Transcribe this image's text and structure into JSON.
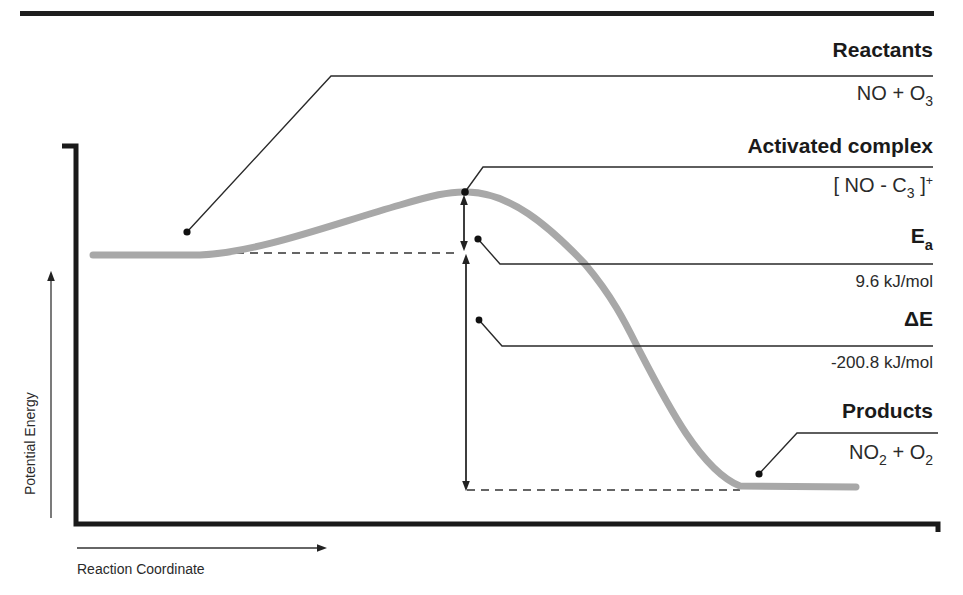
{
  "diagram": {
    "type": "reaction-energy-profile",
    "axes": {
      "x_label": "Reaction Coordinate",
      "y_label": "Potential Energy"
    },
    "labels": {
      "reactants": {
        "title": "Reactants",
        "formula_main": "NO + O",
        "formula_sub": "3"
      },
      "activated_complex": {
        "title": "Activated complex",
        "formula_pre": "[ NO - C",
        "formula_sub": "3",
        "formula_post": " ]",
        "formula_sup": "+"
      },
      "activation_energy": {
        "title_main": "E",
        "title_sub": "a",
        "value": "9.6 kJ/mol"
      },
      "energy_change": {
        "title": "ΔE",
        "value": "-200.8 kJ/mol"
      },
      "products": {
        "title": "Products",
        "formula_a": "NO",
        "formula_a_sub": "2",
        "formula_plus": " + O",
        "formula_b_sub": "2"
      }
    },
    "colors": {
      "curve": "#a8a8a8",
      "lines": "#222222",
      "axis": "#1a1a1a"
    }
  }
}
